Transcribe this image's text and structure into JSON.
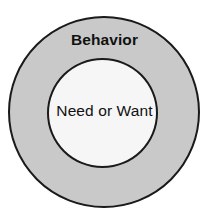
{
  "diagram": {
    "type": "concentric-circles",
    "background_color": "#ffffff",
    "outer": {
      "label": "Behavior",
      "fill_color": "#c9c9c9",
      "stroke_color": "#1a1a1a"
    },
    "inner": {
      "label": "Need or Want",
      "fill_color": "#f6f6f6",
      "stroke_color": "#1a1a1a"
    }
  }
}
